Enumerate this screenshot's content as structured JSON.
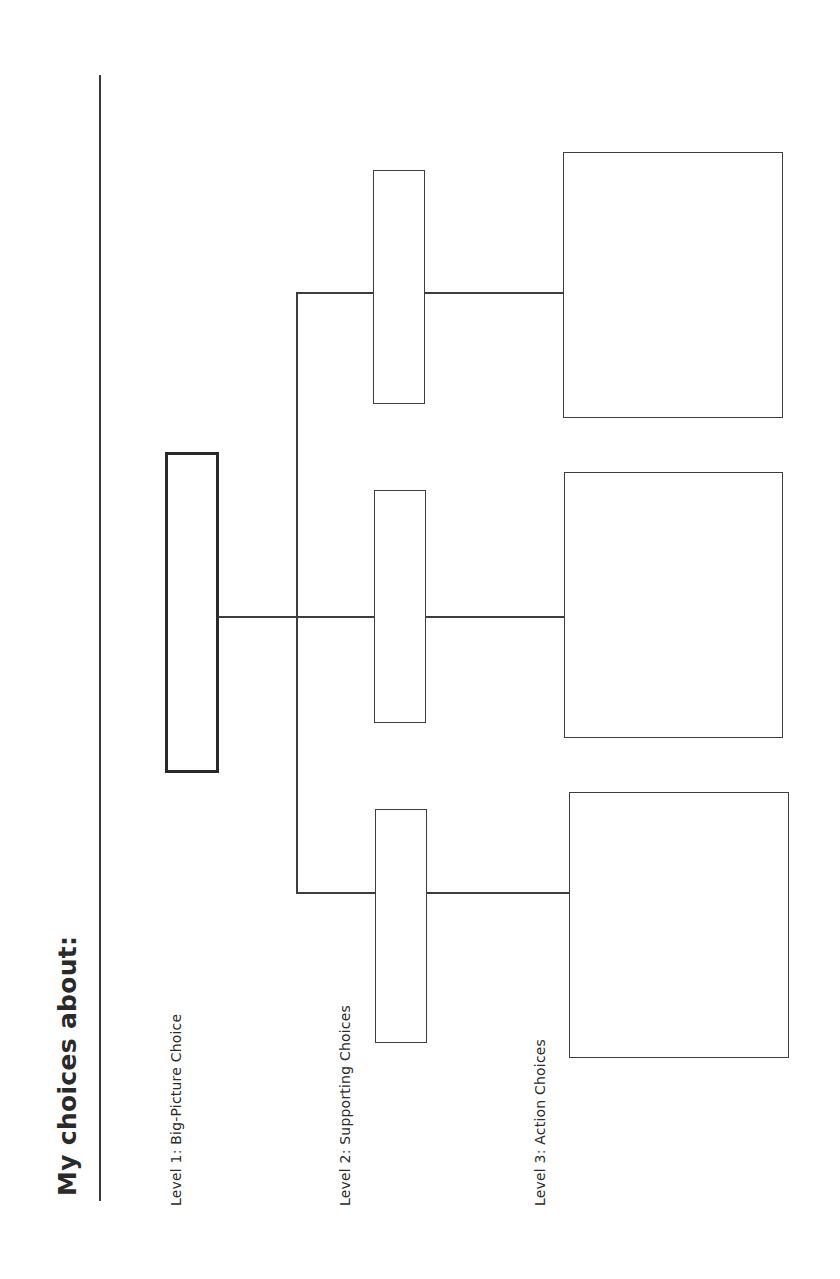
{
  "worksheet": {
    "title": "My choices about:",
    "levels": [
      {
        "label": "Level 1: Big-Picture Choice"
      },
      {
        "label": "Level 2: Supporting Choices"
      },
      {
        "label": "Level 3: Action Choices"
      }
    ]
  },
  "diagram": {
    "orientation": "rotated-90-ccw",
    "nodes": {
      "level1": [
        {
          "id": "big-picture",
          "text": ""
        }
      ],
      "level2": [
        {
          "id": "supporting-1",
          "text": ""
        },
        {
          "id": "supporting-2",
          "text": ""
        },
        {
          "id": "supporting-3",
          "text": ""
        }
      ],
      "level3": [
        {
          "id": "action-1",
          "text": ""
        },
        {
          "id": "action-2",
          "text": ""
        },
        {
          "id": "action-3",
          "text": ""
        }
      ]
    },
    "colors": {
      "stroke": "#3d3d3d",
      "background": "#ffffff",
      "text": "#2a2a2a"
    }
  }
}
